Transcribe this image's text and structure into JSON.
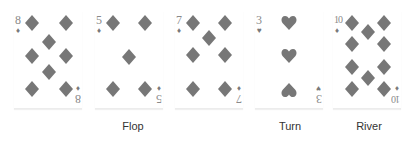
{
  "colors": {
    "pip": "#777777",
    "rank": "#8a8a8a",
    "label": "#333333"
  },
  "cards": [
    {
      "rank": "8",
      "suit": "diamond"
    },
    {
      "rank": "5",
      "suit": "diamond"
    },
    {
      "rank": "7",
      "suit": "diamond"
    },
    {
      "rank": "3",
      "suit": "heart"
    },
    {
      "rank": "10",
      "suit": "diamond"
    }
  ],
  "labels": {
    "flop": "Flop",
    "turn": "Turn",
    "river": "River"
  }
}
